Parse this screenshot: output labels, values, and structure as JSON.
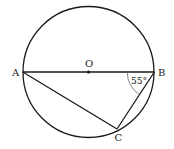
{
  "diagram": {
    "type": "geometry-circle-inscribed-triangle",
    "circle": {
      "center": "O",
      "cx": 88.5,
      "cy": 72,
      "r": 65.5
    },
    "points": {
      "A": {
        "label": "A",
        "x": 22.7,
        "y": 72
      },
      "B": {
        "label": "B",
        "x": 154.3,
        "y": 72
      },
      "O": {
        "label": "O",
        "x": 88.5,
        "y": 72
      },
      "C": {
        "label": "C",
        "x": 117,
        "y": 129
      }
    },
    "segments": [
      "AB",
      "AC",
      "BC"
    ],
    "angle": {
      "vertex": "B",
      "label": "55°",
      "between": [
        "BA",
        "BC"
      ]
    },
    "colors": {
      "stroke": "#1a1a1a",
      "background": "#ffffff"
    }
  }
}
